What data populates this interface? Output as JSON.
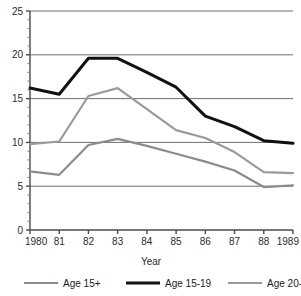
{
  "chart_data": {
    "type": "line",
    "title": "",
    "xlabel": "Year",
    "ylabel": "",
    "x": [
      1980,
      1981,
      1982,
      1983,
      1984,
      1985,
      1986,
      1987,
      1988,
      1989
    ],
    "categories": [
      "1980",
      "81",
      "82",
      "83",
      "84",
      "85",
      "86",
      "87",
      "88",
      "1989"
    ],
    "xlim": [
      1980,
      1989
    ],
    "ylim": [
      0,
      25
    ],
    "yticks": [
      0,
      5,
      10,
      15,
      20,
      25
    ],
    "ytick_labels": [
      "0",
      "5",
      "10",
      "15",
      "20",
      "25"
    ],
    "grid": "horizontal",
    "legend_position": "bottom",
    "series": [
      {
        "name": "Age 15+",
        "color": "#8c8c8c",
        "width": 2.2,
        "values": [
          6.7,
          6.3,
          9.7,
          10.4,
          9.6,
          8.7,
          7.8,
          6.8,
          4.9,
          5.1
        ]
      },
      {
        "name": "Age 15-19",
        "color": "#111111",
        "width": 3.0,
        "values": [
          16.2,
          15.5,
          19.6,
          19.6,
          18.0,
          16.3,
          13.0,
          11.8,
          10.2,
          9.9
        ]
      },
      {
        "name": "Age 20-24",
        "color": "#9a9a9a",
        "width": 2.2,
        "values": [
          9.8,
          10.1,
          15.3,
          16.2,
          13.8,
          11.4,
          10.5,
          8.9,
          6.6,
          6.5
        ]
      }
    ]
  },
  "legend": {
    "items": [
      {
        "label": "Age 15+",
        "color": "#8c8c8c"
      },
      {
        "label": "Age 15-19",
        "color": "#111111"
      },
      {
        "label": "Age 20-24",
        "color": "#9a9a9a"
      }
    ]
  },
  "axes": {
    "x_title": "Year"
  },
  "colors": {
    "grid": "#6f6f6f",
    "axis": "#4a4a4a",
    "background": "#ffffff",
    "text": "#1a1a1a"
  }
}
